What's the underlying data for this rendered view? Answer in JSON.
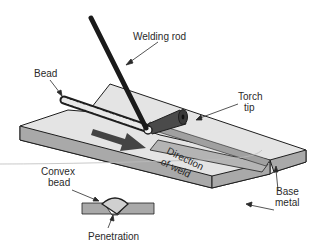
{
  "diagram": {
    "labels": {
      "welding_rod": "Welding rod",
      "bead": "Bead",
      "torch_tip_line1": "Torch",
      "torch_tip_line2": "tip",
      "direction_line1": "Direction",
      "direction_line2": "of weld",
      "convex_bead_line1": "Convex",
      "convex_bead_line2": "bead",
      "base_metal_line1": "Base",
      "base_metal_line2": "metal",
      "penetration": "Penetration"
    },
    "colors": {
      "plate_top": "#e4e4e4",
      "plate_side": "#a9a9a9",
      "outline": "#1e1e1e",
      "rod": "#1a1a1a",
      "torch": "#4a4a4a",
      "arrow": "#444444",
      "bead_fill": "#d0d0d0",
      "text": "#2a2a2a"
    }
  }
}
